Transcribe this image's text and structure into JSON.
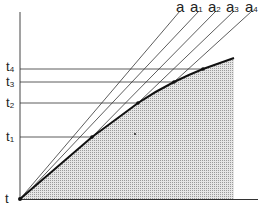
{
  "diagram": {
    "title": "",
    "colors": {
      "ink": "#1a1a1a",
      "thin_line": "#333333",
      "shade": "#cfcfcf"
    },
    "axes": {
      "origin_label": "t",
      "origin": [
        20,
        199
      ],
      "y_axis_top": [
        20,
        12
      ],
      "x_axis_end": [
        258,
        199
      ]
    },
    "y_labels": [
      {
        "base": "t",
        "sub": "1",
        "y": 137
      },
      {
        "base": "t",
        "sub": "2",
        "y": 103
      },
      {
        "base": "t",
        "sub": "3",
        "y": 82
      },
      {
        "base": "t",
        "sub": "4",
        "y": 69
      }
    ],
    "curve_points": [
      [
        20,
        199
      ],
      [
        92,
        137
      ],
      [
        138,
        103
      ],
      [
        174,
        82
      ],
      [
        203,
        69
      ],
      [
        234,
        58
      ]
    ],
    "diagonal_lines": [
      {
        "base": "a",
        "sub": "",
        "from": [
          20,
          199
        ],
        "to": [
          180,
          11
        ]
      },
      {
        "base": "a",
        "sub": "1",
        "from": [
          30,
          192
        ],
        "to": [
          199,
          11
        ]
      },
      {
        "base": "a",
        "sub": "2",
        "from": [
          92,
          137
        ],
        "to": [
          216,
          11
        ]
      },
      {
        "base": "a",
        "sub": "3",
        "from": [
          138,
          103
        ],
        "to": [
          234,
          11
        ]
      },
      {
        "base": "a",
        "sub": "4",
        "from": [
          174,
          82
        ],
        "to": [
          252,
          11
        ]
      }
    ],
    "top_labels": [
      {
        "base": "a",
        "sub": "",
        "x": 176
      },
      {
        "base": "a",
        "sub": "1",
        "x": 190
      },
      {
        "base": "a",
        "sub": "2",
        "x": 208
      },
      {
        "base": "a",
        "sub": "3",
        "x": 226
      },
      {
        "base": "a",
        "sub": "4",
        "x": 245
      }
    ],
    "shaded_region_right_x": 234
  }
}
